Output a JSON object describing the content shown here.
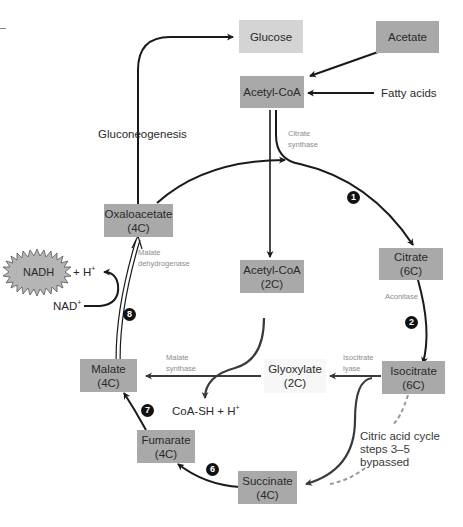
{
  "diagram": {
    "nodes": {
      "glucose": {
        "label": "Glucose",
        "shade": "light"
      },
      "acetate": {
        "label": "Acetate",
        "shade": "dark"
      },
      "acetyl_coa_top": {
        "label": "Acetyl-CoA",
        "shade": "dark"
      },
      "fatty_acids": {
        "label": "Fatty acids"
      },
      "oxaloacetate": {
        "label": "Oxaloacetate",
        "carbons": "(4C)"
      },
      "acetyl_coa_mid": {
        "label": "Acetyl-CoA",
        "carbons": "(2C)"
      },
      "citrate": {
        "label": "Citrate",
        "carbons": "(6C)"
      },
      "isocitrate": {
        "label": "Isocitrate",
        "carbons": "(6C)"
      },
      "glyoxylate": {
        "label": "Glyoxylate",
        "carbons": "(2C)"
      },
      "malate": {
        "label": "Malate",
        "carbons": "(4C)"
      },
      "fumarate": {
        "label": "Fumarate",
        "carbons": "(4C)"
      },
      "succinate": {
        "label": "Succinate",
        "carbons": "(4C)"
      },
      "nadh": {
        "label": "NADH",
        "suffix": "+ H",
        "suffix_sup": "+"
      },
      "nad": {
        "label": "NAD",
        "sup": "+"
      },
      "coa_sh": {
        "label": "CoA-SH + H",
        "sup": "+"
      }
    },
    "process_labels": {
      "gluconeogenesis": "Gluconeogenesis",
      "bypass_line1": "Citric acid cycle",
      "bypass_line2": "steps 3–5",
      "bypass_line3": "bypassed"
    },
    "enzymes": {
      "citrate_synthase": [
        "Citrate",
        "synthase"
      ],
      "malate_dehydrogenase": [
        "Malate",
        "dehydrogenase"
      ],
      "aconitase": [
        "Aconitase"
      ],
      "isocitrate_lyase": [
        "Isocitrate",
        "lyase"
      ],
      "malate_synthase": [
        "Malate",
        "synthase"
      ]
    },
    "steps": [
      "1",
      "2",
      "6",
      "7",
      "8"
    ],
    "colors": {
      "box_dark": "#a9a9a9",
      "box_light": "#d4d4d4",
      "arrow": "#1a1a1a",
      "enzyme_text": "#8c8c8c",
      "bypass_dashed": "#9a9a9a",
      "nadh_star": "#b5b5b5"
    }
  }
}
